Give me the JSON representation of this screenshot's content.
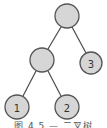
{
  "diagram": {
    "type": "binary-tree",
    "colors": {
      "node_fill": "#d6d6d6",
      "node_stroke": "#555555",
      "edge": "#4a4a4a"
    },
    "nodes": [
      {
        "id": "root",
        "label": "",
        "cx": 67,
        "cy": 16,
        "r": 12
      },
      {
        "id": "left",
        "label": "",
        "cx": 42,
        "cy": 60,
        "r": 12
      },
      {
        "id": "n3",
        "label": "3",
        "cx": 91,
        "cy": 63,
        "r": 11
      },
      {
        "id": "n1",
        "label": "1",
        "cx": 17,
        "cy": 107,
        "r": 12
      },
      {
        "id": "n2",
        "label": "2",
        "cx": 67,
        "cy": 107,
        "r": 12
      }
    ],
    "edges": [
      {
        "from": "root",
        "to": "left"
      },
      {
        "from": "root",
        "to": "n3"
      },
      {
        "from": "left",
        "to": "n1"
      },
      {
        "from": "left",
        "to": "n2"
      }
    ],
    "caption": "图 4.5 — 二叉树"
  }
}
